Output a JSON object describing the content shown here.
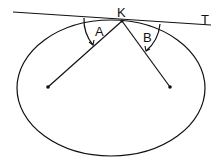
{
  "diagram": {
    "labels": {
      "point": "K",
      "tangent": "T",
      "angle_left": "A",
      "angle_right": "B"
    },
    "colors": {
      "stroke": "#111111",
      "background": "#ffffff"
    }
  }
}
